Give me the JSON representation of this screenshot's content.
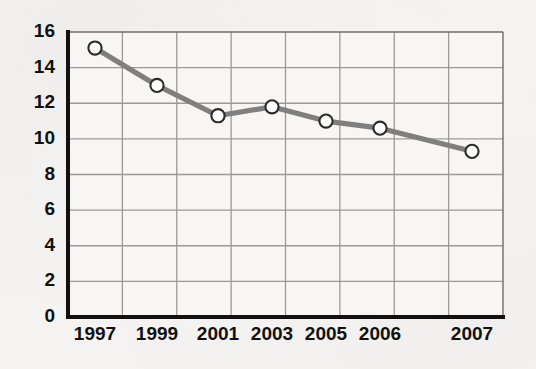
{
  "chart_data": {
    "type": "line",
    "title": "",
    "subtitle": "",
    "xlabel": "",
    "ylabel": "",
    "categories": [
      "1997",
      "1999",
      "2001",
      "2003",
      "2005",
      "2006",
      "2007"
    ],
    "values": [
      15.1,
      13.0,
      11.3,
      11.8,
      11.0,
      10.6,
      9.3
    ],
    "series": [
      {
        "name": "series-1",
        "values": [
          15.1,
          13.0,
          11.3,
          11.8,
          11.0,
          10.6,
          9.3
        ]
      }
    ],
    "ylim": [
      0,
      16
    ],
    "ytick_values": [
      0,
      2,
      4,
      6,
      8,
      10,
      12,
      14,
      16
    ],
    "ytick_labels": [
      "0",
      "2",
      "4",
      "6",
      "8",
      "10",
      "12",
      "14",
      "16"
    ],
    "xtick_labels": [
      "1997",
      "1999",
      "2001",
      "2003",
      "2005",
      "2006",
      "2007"
    ],
    "grid": true,
    "grid_horizontal": true,
    "grid_vertical": true,
    "legend": false,
    "legend_position": "none",
    "annotations": [],
    "marker": "circle-open",
    "colors": {
      "line": "#7f7f7f",
      "marker_fill": "#ffffff",
      "marker_edge": "#2b2b2b",
      "axis": "#000000",
      "grid": "#9a9a9a",
      "background": "#f4f3f1",
      "text": "#111111"
    }
  },
  "layout": {
    "plot_left": 68,
    "plot_right": 503,
    "plot_top": 32,
    "plot_bottom": 317,
    "grid_columns": 8,
    "point_x_positions": [
      95,
      157,
      218,
      272,
      326,
      380,
      472
    ]
  }
}
